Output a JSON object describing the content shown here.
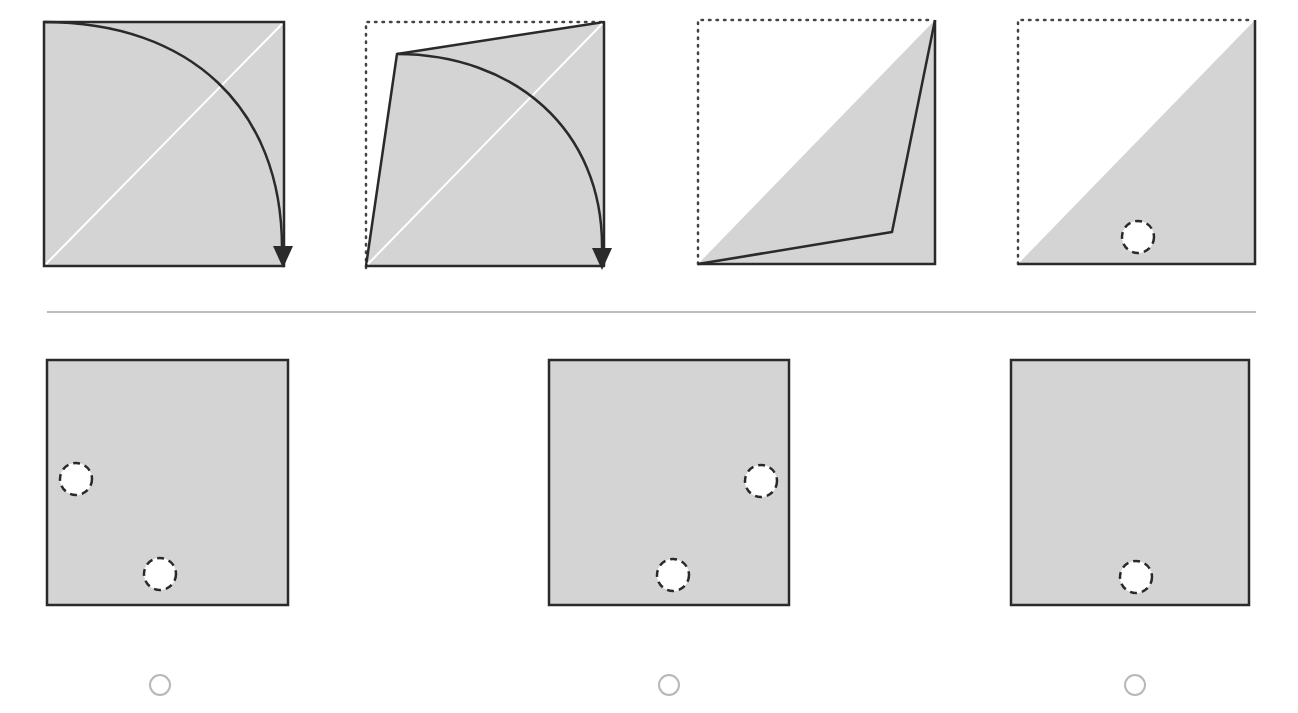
{
  "colors": {
    "paper_fill": "#d4d4d4",
    "outline": "#2a2a2a",
    "crease_line": "#ffffff",
    "divider": "#bcbcbc",
    "radio_border": "#b8b8b8",
    "background": "#ffffff"
  },
  "question": {
    "folding_steps": [
      {
        "step": 1,
        "description": "Square paper with diagonal crease; top-left corner folded along curved arrow down to bottom-right"
      },
      {
        "step": 2,
        "description": "Folded shape with dotted outline of original square; curved arrow continues fold to bottom-right"
      },
      {
        "step": 3,
        "description": "Paper folded into triangle along diagonal; dotted outline of original square"
      },
      {
        "step": 4,
        "description": "Triangle with one punched hole (dashed circle) near bottom center"
      }
    ]
  },
  "options": [
    {
      "id": "A",
      "label": "",
      "holes": [
        "left-middle",
        "bottom-center-left"
      ],
      "selected": false
    },
    {
      "id": "B",
      "label": "",
      "holes": [
        "right-middle",
        "bottom-center"
      ],
      "selected": false
    },
    {
      "id": "C",
      "label": "",
      "holes": [
        "bottom-center"
      ],
      "selected": false
    }
  ]
}
